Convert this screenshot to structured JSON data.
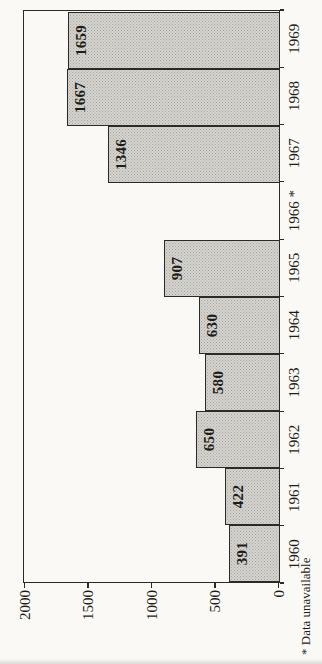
{
  "page": {
    "background": "#faf9f6"
  },
  "chart_data": {
    "type": "bar",
    "rotation": "vertical bar chart rotated 90deg counter-clockwise on the page",
    "title": "",
    "xlabel": "",
    "ylabel": "",
    "categories": [
      "1960",
      "1961",
      "1962",
      "1963",
      "1964",
      "1965",
      "1966",
      "1967",
      "1968",
      "1969"
    ],
    "xtick_labels": [
      "1960",
      "1961",
      "1962",
      "1963",
      "1964",
      "1965",
      "1966 *",
      "1967",
      "1968",
      "1969"
    ],
    "values": [
      391,
      422,
      650,
      580,
      630,
      907,
      null,
      1346,
      1667,
      1659
    ],
    "bar_labels": [
      "391",
      "422",
      "650",
      "580",
      "630",
      "907",
      "",
      "1346",
      "1667",
      "1659"
    ],
    "ylim": [
      0,
      2000
    ],
    "yticks": [
      0,
      500,
      1000,
      1500,
      2000
    ],
    "ytick_labels": [
      "0",
      "500",
      "1000",
      "1500",
      "2000"
    ],
    "grid": false,
    "legend": null,
    "footnote": "* Data unavailable",
    "colors": {
      "bar_fill": "#d6d4d0",
      "bar_dots": "#a8a6a0",
      "axis_line": "#2b2a24",
      "text": "#1d1c18",
      "page_background": "#faf9f6"
    }
  }
}
